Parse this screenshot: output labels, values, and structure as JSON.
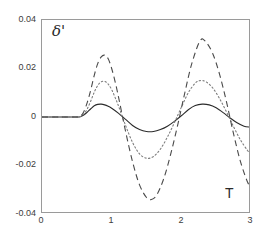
{
  "chart_data": {
    "type": "line",
    "title": "",
    "subtitle": "",
    "xlabel": "T",
    "ylabel": "δ'",
    "xlim": [
      0,
      3
    ],
    "ylim": [
      -0.04,
      0.04
    ],
    "xticks": [
      0,
      1,
      2,
      3
    ],
    "xticklabels": [
      "0",
      "1",
      "2",
      "3"
    ],
    "yticks": [
      0.04,
      0.02,
      0,
      -0.02,
      -0.04
    ],
    "yticklabels": [
      "0.04",
      "0.02",
      "0",
      "-0.02",
      "-0.04"
    ],
    "grid": false,
    "legend": null,
    "legend_position": "none",
    "annotations": [
      {
        "text": "δ'",
        "x": 0.16,
        "y": 0.0355,
        "style": "italic-serif"
      },
      {
        "text": "T",
        "x": 2.65,
        "y": -0.0315,
        "style": "upright-sans"
      }
    ],
    "series": [
      {
        "name": "solid",
        "linestyle": "solid",
        "color": "#2b2b2b",
        "linewidth": 1.1,
        "x": [
          0.0,
          0.1,
          0.2,
          0.3,
          0.4,
          0.5,
          0.55,
          0.6,
          0.65,
          0.7,
          0.75,
          0.8,
          0.85,
          0.9,
          0.95,
          1.0,
          1.1,
          1.2,
          1.3,
          1.4,
          1.5,
          1.6,
          1.7,
          1.8,
          1.9,
          2.0,
          2.1,
          2.2,
          2.3,
          2.4,
          2.5,
          2.6,
          2.7,
          2.8,
          2.9,
          3.0
        ],
        "y": [
          0.0,
          0.0,
          0.0,
          0.0,
          0.0,
          0.0,
          0.0001,
          0.0008,
          0.002,
          0.0034,
          0.0046,
          0.0052,
          0.0053,
          0.005,
          0.0044,
          0.0036,
          0.0015,
          -0.001,
          -0.0035,
          -0.0052,
          -0.006,
          -0.006,
          -0.0052,
          -0.0038,
          -0.0018,
          0.0005,
          0.003,
          0.0047,
          0.0053,
          0.005,
          0.0038,
          0.0018,
          -0.0004,
          -0.0024,
          -0.0038,
          -0.0042
        ]
      },
      {
        "name": "dotted",
        "linestyle": "dotted",
        "color": "#7d7d7d",
        "linewidth": 1.1,
        "x": [
          0.0,
          0.1,
          0.2,
          0.3,
          0.4,
          0.5,
          0.55,
          0.6,
          0.65,
          0.7,
          0.75,
          0.8,
          0.85,
          0.9,
          0.95,
          1.0,
          1.05,
          1.1,
          1.2,
          1.3,
          1.4,
          1.5,
          1.6,
          1.7,
          1.8,
          1.9,
          2.0,
          2.1,
          2.2,
          2.27,
          2.35,
          2.45,
          2.55,
          2.65,
          2.75,
          2.85,
          2.95,
          3.0
        ],
        "y": [
          0.0,
          0.0,
          0.0,
          0.0,
          0.0,
          0.0,
          0.0002,
          0.0012,
          0.0034,
          0.0066,
          0.0102,
          0.013,
          0.0145,
          0.0147,
          0.0136,
          0.0113,
          0.008,
          0.0044,
          -0.0035,
          -0.0105,
          -0.0152,
          -0.017,
          -0.0163,
          -0.0132,
          -0.0083,
          -0.0024,
          0.004,
          0.01,
          0.014,
          0.015,
          0.0146,
          0.012,
          0.0075,
          0.002,
          -0.004,
          -0.0095,
          -0.0138,
          -0.0152
        ]
      },
      {
        "name": "dashed",
        "linestyle": "dashed",
        "color": "#4a4a4a",
        "linewidth": 1.1,
        "x": [
          0.0,
          0.1,
          0.2,
          0.3,
          0.4,
          0.5,
          0.55,
          0.6,
          0.65,
          0.7,
          0.75,
          0.8,
          0.85,
          0.9,
          0.95,
          1.0,
          1.05,
          1.1,
          1.2,
          1.3,
          1.4,
          1.5,
          1.57,
          1.65,
          1.75,
          1.85,
          1.95,
          2.05,
          2.15,
          2.27,
          2.35,
          2.45,
          2.55,
          2.65,
          2.75,
          2.85,
          2.95,
          3.0
        ],
        "y": [
          0.0,
          0.0,
          0.0,
          0.0,
          0.0,
          0.0,
          0.0003,
          0.0022,
          0.006,
          0.0112,
          0.0172,
          0.022,
          0.0248,
          0.0255,
          0.024,
          0.02,
          0.0145,
          0.008,
          -0.006,
          -0.0185,
          -0.028,
          -0.0332,
          -0.034,
          -0.032,
          -0.0252,
          -0.015,
          -0.003,
          0.01,
          0.022,
          0.0315,
          0.031,
          0.0262,
          0.0175,
          0.006,
          -0.007,
          -0.0185,
          -0.0268,
          -0.029
        ]
      }
    ]
  },
  "axes": {
    "frame_color": "#9a9a9a",
    "background": "#ffffff"
  }
}
